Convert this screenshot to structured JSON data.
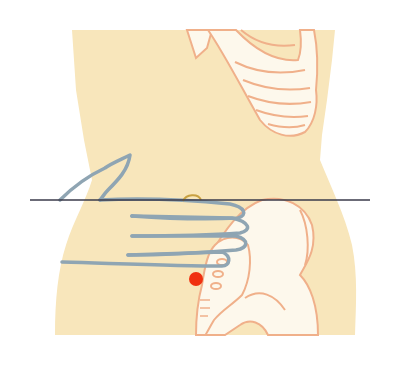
{
  "diagram": {
    "title": "",
    "colors": {
      "background": "#ffffff",
      "skin": "#f8e6bb",
      "bone_fill": "#fdf8ec",
      "bone_outline": "#f0b08a",
      "hand_outline": "#8fa5b3",
      "reference_line": "#3a3a4a",
      "navel": "#c8a040",
      "point_marker": "#f0300f"
    },
    "elements": {
      "torso": {
        "label": "torso silhouette"
      },
      "ribcage": {
        "label": "lower ribcage"
      },
      "pelvis": {
        "label": "pelvis / hip bone"
      },
      "sacrum": {
        "label": "sacrum"
      },
      "navel": {
        "label": "navel",
        "x": 192,
        "y": 199
      },
      "reference_line": {
        "label": "horizontal navel line",
        "x1": 30,
        "x2": 370,
        "y": 200
      },
      "hand": {
        "label": "hand placed below navel, four fingers",
        "fingers": 4
      },
      "point": {
        "label": "acupoint marker",
        "x": 196,
        "y": 279,
        "r": 7
      }
    }
  }
}
